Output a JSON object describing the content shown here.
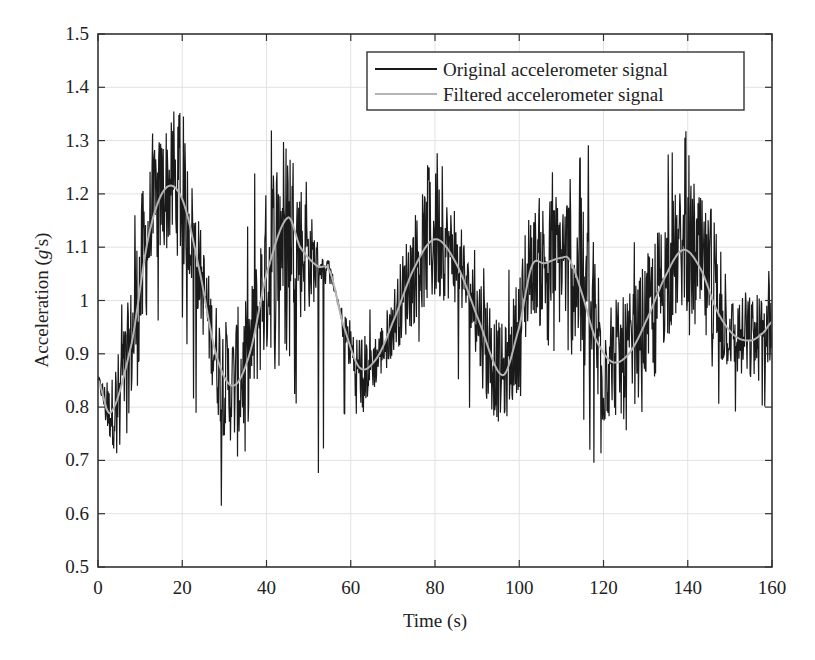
{
  "chart_data": {
    "type": "line",
    "title": "",
    "xlabel": "Time (s)",
    "ylabel_prefix": "Acceleration (",
    "ylabel_var": "g",
    "ylabel_suffix": "'s)",
    "ylabel": "Acceleration (g's)",
    "xlim": [
      0,
      160
    ],
    "ylim": [
      0.5,
      1.5
    ],
    "xticks": [
      0,
      20,
      40,
      60,
      80,
      100,
      120,
      140,
      160
    ],
    "yticks": [
      0.5,
      0.6,
      0.7,
      0.8,
      0.9,
      1,
      1.1,
      1.2,
      1.3,
      1.4,
      1.5
    ],
    "ytick_labels": [
      "0.5",
      "0.6",
      "0.7",
      "0.8",
      "0.9",
      "1",
      "1.1",
      "1.2",
      "1.3",
      "1.4",
      "1.5"
    ],
    "grid": true,
    "legend_position": "upper right",
    "series": [
      {
        "name": "Original accelerometer signal",
        "color": "#1a1a1a",
        "style": "noisy raw signal around the filtered trend",
        "approx_envelope": {
          "t": [
            0,
            3,
            10,
            16,
            20,
            27,
            32,
            38,
            45,
            51,
            55,
            62,
            70,
            80,
            88,
            96,
            100,
            106,
            112,
            117,
            122,
            130,
            139,
            145,
            150,
            155,
            160
          ],
          "max": [
            0.86,
            0.86,
            1.25,
            1.38,
            1.37,
            1.05,
            0.98,
            1.3,
            1.39,
            1.18,
            1.02,
            0.97,
            1.1,
            1.3,
            1.1,
            1.07,
            1.11,
            1.27,
            1.25,
            1.3,
            1.0,
            1.2,
            1.33,
            1.2,
            1.03,
            1.04,
            1.06
          ],
          "min": [
            0.7,
            0.67,
            0.8,
            1.0,
            0.95,
            0.59,
            0.62,
            0.8,
            0.9,
            0.62,
            0.78,
            0.76,
            0.88,
            0.94,
            0.8,
            0.73,
            0.8,
            0.91,
            0.89,
            0.69,
            0.7,
            0.8,
            0.95,
            0.79,
            0.77,
            0.76,
            0.8
          ]
        }
      },
      {
        "name": "Filtered accelerometer signal",
        "color": "#b4b4b4",
        "x": [
          0,
          3,
          8,
          12,
          16,
          20,
          24,
          28,
          32,
          36,
          40,
          45,
          48,
          52,
          55,
          58,
          62,
          66,
          70,
          75,
          80,
          85,
          90,
          96,
          100,
          103,
          106,
          110,
          112,
          115,
          118,
          122,
          126,
          130,
          135,
          139,
          143,
          147,
          151,
          155,
          158,
          160
        ],
        "y": [
          0.85,
          0.79,
          0.92,
          1.12,
          1.21,
          1.19,
          1.06,
          0.9,
          0.84,
          0.9,
          1.05,
          1.155,
          1.1,
          1.065,
          1.055,
          0.96,
          0.875,
          0.89,
          0.96,
          1.06,
          1.115,
          1.07,
          0.97,
          0.86,
          0.95,
          1.065,
          1.07,
          1.08,
          1.075,
          1.01,
          0.93,
          0.885,
          0.9,
          0.96,
          1.05,
          1.095,
          1.06,
          0.98,
          0.935,
          0.925,
          0.94,
          0.96
        ]
      }
    ]
  },
  "legend": {
    "items": [
      {
        "label": "Original accelerometer signal",
        "color": "#1a1a1a"
      },
      {
        "label": "Filtered accelerometer signal",
        "color": "#b4b4b4"
      }
    ]
  }
}
